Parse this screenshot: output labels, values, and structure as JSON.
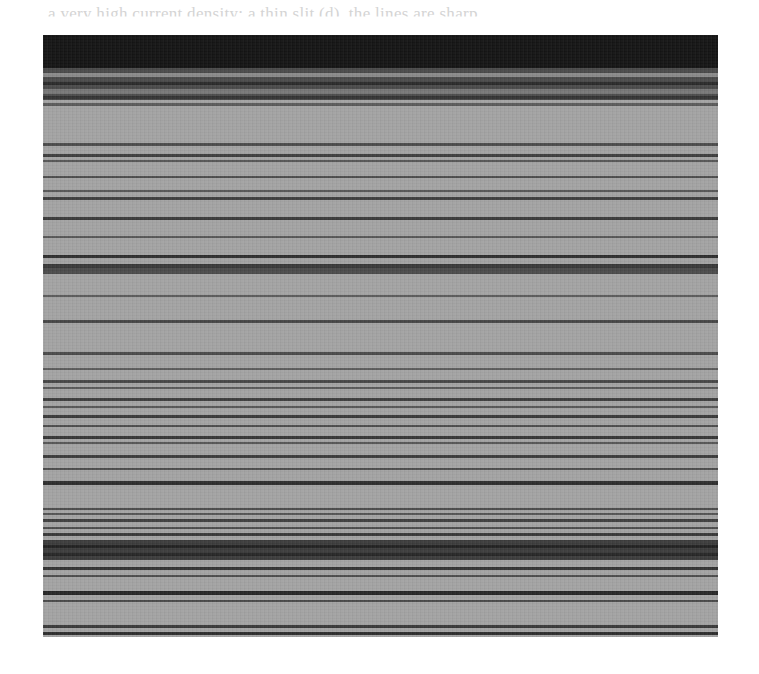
{
  "page": {
    "cropped_header_text": "a very high current density; a thin slit (d), the lines are sharp",
    "bottom_bleed_text": ""
  },
  "figure": {
    "background_color": "#a3a3a3",
    "top_dark_region": {
      "y_start": 0,
      "y_end": 33,
      "color": "#141414"
    },
    "mixed_region": {
      "y_start": 33,
      "y_end": 65,
      "color": "#4a4a4a"
    },
    "bands": [
      {
        "y": 38,
        "h": 4,
        "color": "#8a8a8a"
      },
      {
        "y": 47,
        "h": 3,
        "color": "#2a2a2a"
      },
      {
        "y": 54,
        "h": 5,
        "color": "#777777"
      },
      {
        "y": 61,
        "h": 3,
        "color": "#333333"
      },
      {
        "y": 68,
        "h": 3,
        "color": "#5a5a5a"
      },
      {
        "y": 108,
        "h": 3,
        "color": "#4c4c4c"
      },
      {
        "y": 119,
        "h": 3,
        "color": "#3e3e3e"
      },
      {
        "y": 125,
        "h": 2,
        "color": "#555555"
      },
      {
        "y": 141,
        "h": 2,
        "color": "#4e4e4e"
      },
      {
        "y": 155,
        "h": 2,
        "color": "#555555"
      },
      {
        "y": 162,
        "h": 3,
        "color": "#3f3f3f"
      },
      {
        "y": 182,
        "h": 3,
        "color": "#3a3a3a"
      },
      {
        "y": 201,
        "h": 2,
        "color": "#585858"
      },
      {
        "y": 220,
        "h": 3,
        "color": "#2e2e2e"
      },
      {
        "y": 229,
        "h": 4,
        "color": "#393939"
      },
      {
        "y": 233,
        "h": 6,
        "color": "#4a4a4a"
      },
      {
        "y": 260,
        "h": 2,
        "color": "#5a5a5a"
      },
      {
        "y": 285,
        "h": 3,
        "color": "#474747"
      },
      {
        "y": 317,
        "h": 3,
        "color": "#4a4a4a"
      },
      {
        "y": 333,
        "h": 2,
        "color": "#5c5c5c"
      },
      {
        "y": 345,
        "h": 3,
        "color": "#474747"
      },
      {
        "y": 352,
        "h": 2,
        "color": "#5a5a5a"
      },
      {
        "y": 363,
        "h": 3,
        "color": "#3e3e3e"
      },
      {
        "y": 371,
        "h": 2,
        "color": "#555555"
      },
      {
        "y": 380,
        "h": 3,
        "color": "#3a3a3a"
      },
      {
        "y": 390,
        "h": 2,
        "color": "#4d4d4d"
      },
      {
        "y": 401,
        "h": 3,
        "color": "#363636"
      },
      {
        "y": 407,
        "h": 2,
        "color": "#555555"
      },
      {
        "y": 420,
        "h": 3,
        "color": "#3c3c3c"
      },
      {
        "y": 433,
        "h": 2,
        "color": "#4d4d4d"
      },
      {
        "y": 446,
        "h": 4,
        "color": "#2e2e2e"
      },
      {
        "y": 473,
        "h": 2,
        "color": "#4a4a4a"
      },
      {
        "y": 478,
        "h": 2,
        "color": "#555555"
      },
      {
        "y": 484,
        "h": 3,
        "color": "#3e3e3e"
      },
      {
        "y": 492,
        "h": 2,
        "color": "#4d4d4d"
      },
      {
        "y": 498,
        "h": 3,
        "color": "#3a3a3a"
      },
      {
        "y": 505,
        "h": 20,
        "color": "#3c3c3c"
      },
      {
        "y": 510,
        "h": 3,
        "color": "#222222"
      },
      {
        "y": 518,
        "h": 3,
        "color": "#262626"
      },
      {
        "y": 532,
        "h": 3,
        "color": "#333333"
      },
      {
        "y": 540,
        "h": 2,
        "color": "#4d4d4d"
      },
      {
        "y": 556,
        "h": 4,
        "color": "#262626"
      },
      {
        "y": 565,
        "h": 2,
        "color": "#4a4a4a"
      },
      {
        "y": 590,
        "h": 3,
        "color": "#3a3a3a"
      },
      {
        "y": 597,
        "h": 3,
        "color": "#2e2e2e"
      }
    ]
  }
}
